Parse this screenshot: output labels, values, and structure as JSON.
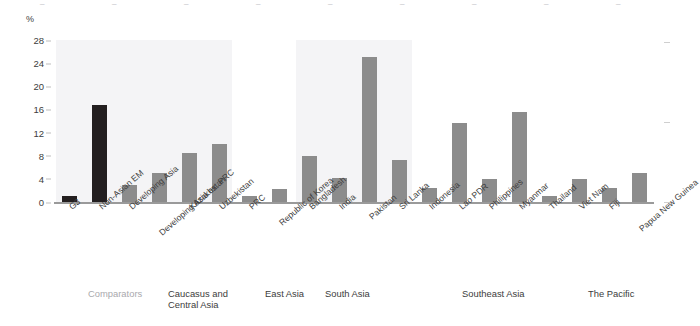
{
  "topstrip": {
    "fragments": [
      "_",
      "_",
      "_",
      "_",
      "_",
      "_",
      "_",
      "_",
      "_"
    ]
  },
  "chart_data": {
    "type": "bar",
    "title": "",
    "xlabel": "",
    "ylabel": "%",
    "ylim": [
      0,
      28
    ],
    "yticks": [
      0,
      4,
      8,
      12,
      16,
      20,
      24,
      28
    ],
    "grid": false,
    "legend": "none",
    "categories": [
      "G3",
      "Non-Asian EM",
      "Developing Asia",
      "Developing Asia ex. PRC",
      "Kazakhstan",
      "Uzbekistan",
      "PRC",
      "Republic of Korea",
      "Bangladesh",
      "India",
      "Pakistan",
      "Sri Lanka",
      "Indonesia",
      "Lao PDR",
      "Philippines",
      "Myanmar",
      "Thailand",
      "Viet Nam",
      "Fiji",
      "Papua New Guinea"
    ],
    "values": [
      1.0,
      16.7,
      3.0,
      5.0,
      8.5,
      10.0,
      1.0,
      2.2,
      8.0,
      4.2,
      25.0,
      7.2,
      2.5,
      13.6,
      4.0,
      15.5,
      1.0,
      4.0,
      2.5,
      5.0
    ],
    "bar_colors": [
      "#231f20",
      "#231f20",
      "#8c8c8c",
      "#8c8c8c",
      "#8c8c8c",
      "#8c8c8c",
      "#8c8c8c",
      "#8c8c8c",
      "#8c8c8c",
      "#8c8c8c",
      "#8c8c8c",
      "#8c8c8c",
      "#8c8c8c",
      "#8c8c8c",
      "#8c8c8c",
      "#8c8c8c",
      "#8c8c8c",
      "#8c8c8c",
      "#8c8c8c",
      "#8c8c8c"
    ],
    "groups": [
      {
        "label": "Comparators",
        "start": 0,
        "end": 5,
        "muted": true
      },
      {
        "label": "Caucasus and\nCentral Asia",
        "start": 4,
        "end": 5,
        "muted": false
      },
      {
        "label": "East Asia",
        "start": 6,
        "end": 7,
        "muted": false
      },
      {
        "label": "South Asia",
        "start": 8,
        "end": 11,
        "muted": false
      },
      {
        "label": "Southeast Asia",
        "start": 12,
        "end": 17,
        "muted": false
      },
      {
        "label": "The Pacific",
        "start": 18,
        "end": 19,
        "muted": false
      }
    ],
    "shaded_bands": [
      {
        "start": 0,
        "end": 5
      },
      {
        "start": 8,
        "end": 11
      }
    ],
    "colors": {
      "dark_bar": "#231f20",
      "gray_bar": "#8c8c8c",
      "band": "#f4f4f6",
      "axis": "#9a9a9a",
      "text": "#3c3c3c",
      "muted_text": "#a9a9ad"
    }
  }
}
